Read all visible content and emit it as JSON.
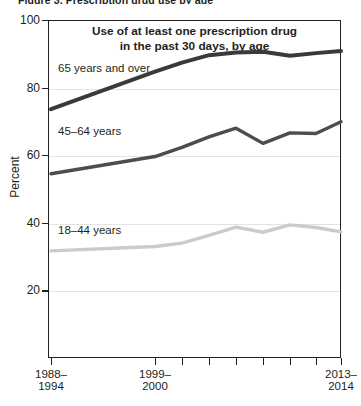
{
  "top_clipped_text": "Figure 3. Prescription drug use by age",
  "axis": {
    "y_title": "Percent",
    "y_ticks": [
      100,
      80,
      60,
      40,
      20
    ],
    "x_tick_labels": [
      {
        "line1": "1988–",
        "line2": "1994"
      },
      {
        "line1": "1999–",
        "line2": "2000"
      },
      {
        "line1": "2013–",
        "line2": "2014"
      }
    ]
  },
  "chart_data": {
    "type": "line",
    "title": "Use of at least one prescription drug in the past 30 days, by age",
    "title_line1": "Use of at least one prescription drug",
    "title_line2": "in the past 30 days, by age",
    "xlabel": "",
    "ylabel": "Percent",
    "ylim": [
      0,
      100
    ],
    "grid": true,
    "legend_position": "inline-labels",
    "x": [
      "1988-1994",
      "1999-2000",
      "2001-2002",
      "2003-2004",
      "2005-2006",
      "2007-2008",
      "2009-2010",
      "2011-2012",
      "2013-2014"
    ],
    "x_tick_positions_px": [
      51,
      155,
      182,
      209,
      236,
      263,
      290,
      316,
      341
    ],
    "series": [
      {
        "name": "65 years and over",
        "label": "65 years and over",
        "color": "#3a3a3a",
        "width": 4.0,
        "values": [
          73.6,
          84.7,
          87.4,
          89.6,
          90.4,
          90.6,
          89.4,
          90.2,
          90.8
        ]
      },
      {
        "name": "45–64 years",
        "label": "45–64 years",
        "color": "#4d4d4d",
        "width": 3.4,
        "values": [
          54.5,
          59.6,
          62.3,
          65.4,
          68.0,
          63.5,
          66.6,
          66.4,
          69.9
        ]
      },
      {
        "name": "18–44 years",
        "label": "18–44 years",
        "color": "#cbcbcb",
        "width": 3.4,
        "values": [
          31.7,
          33.0,
          34.0,
          36.3,
          38.7,
          37.2,
          39.4,
          38.6,
          37.3
        ]
      }
    ]
  },
  "series_label_positions": [
    {
      "left": 58,
      "top": 62
    },
    {
      "left": 58,
      "top": 125
    },
    {
      "left": 58,
      "top": 224
    }
  ]
}
